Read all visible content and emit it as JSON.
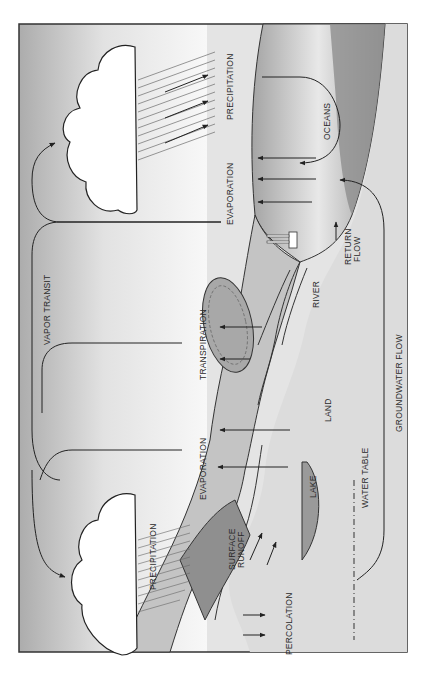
{
  "diagram": {
    "orientation": "rotated 90 degrees counter-clockwise",
    "labels": {
      "precipitation_top": "PRECIPITATION",
      "precipitation_bottom": "PRECIPITATION",
      "vapor_transit": "VAPOR TRANSIT",
      "evaporation_ocean": "EVAPORATION",
      "evaporation_lake": "EVAPORATION",
      "transpiration": "TRANSPIRATION",
      "oceans": "OCEANS",
      "river": "RIVER",
      "return_flow_1": "RETURN",
      "return_flow_2": "FLOW",
      "land": "LAND",
      "groundwater_flow": "GROUNDWATER FLOW",
      "water_table": "WATER TABLE",
      "lake": "LAKE",
      "surface_runoff_1": "SURFACE",
      "surface_runoff_2": "RUNOFF",
      "percolation": "PERCOLATION"
    },
    "colors": {
      "sky_dark": "#b0b0b0",
      "sky_light": "#f4f4f4",
      "ocean": "#8e8e8e",
      "land": "#cfcfcf",
      "ground": "#e6e6e6",
      "line": "#222222",
      "cloud": "#ffffff"
    }
  }
}
